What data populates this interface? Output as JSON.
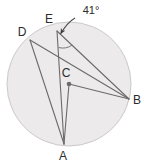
{
  "figure": {
    "type": "circle-geometry-diagram",
    "background_color": "#ffffff",
    "circle": {
      "name": "circle-O",
      "center_label": "C",
      "center_x": 69,
      "center_y": 84,
      "radius": 62,
      "fill_color": "#eceaea",
      "stroke_color": "#c9c6c6"
    },
    "points": [
      {
        "id": "D",
        "label": "D",
        "x": 30,
        "y": 40,
        "label_x": 22,
        "label_y": 36,
        "on_circle": true
      },
      {
        "id": "E",
        "label": "E",
        "x": 57,
        "y": 31,
        "label_x": 49,
        "label_y": 23,
        "on_circle": true
      },
      {
        "id": "B",
        "label": "B",
        "x": 129,
        "y": 99,
        "label_x": 135,
        "label_y": 104,
        "on_circle": true
      },
      {
        "id": "A",
        "label": "A",
        "x": 64,
        "y": 144,
        "label_x": 60,
        "label_y": 160,
        "on_circle": true
      },
      {
        "id": "C",
        "label": "C",
        "x": 69,
        "y": 84,
        "label_x": 63,
        "label_y": 76,
        "on_circle": false
      }
    ],
    "segments": [
      {
        "name": "segment-D-B",
        "from": "D",
        "to": "B"
      },
      {
        "name": "segment-D-A",
        "from": "D",
        "to": "A"
      },
      {
        "name": "segment-E-B",
        "from": "E",
        "to": "B"
      },
      {
        "name": "segment-E-A",
        "from": "E",
        "to": "A"
      },
      {
        "name": "segment-C-B",
        "from": "C",
        "to": "B"
      },
      {
        "name": "segment-C-A",
        "from": "C",
        "to": "A"
      }
    ],
    "angle_annotation": {
      "name": "angle-at-E",
      "value_label": "41°",
      "label_x": 77,
      "label_y": 14,
      "vertex": "E",
      "arc_color": "#6e6e6e",
      "leader_color": "#4a4a4a"
    },
    "line_color": "#6b6b6b",
    "line_width": 1.1
  }
}
